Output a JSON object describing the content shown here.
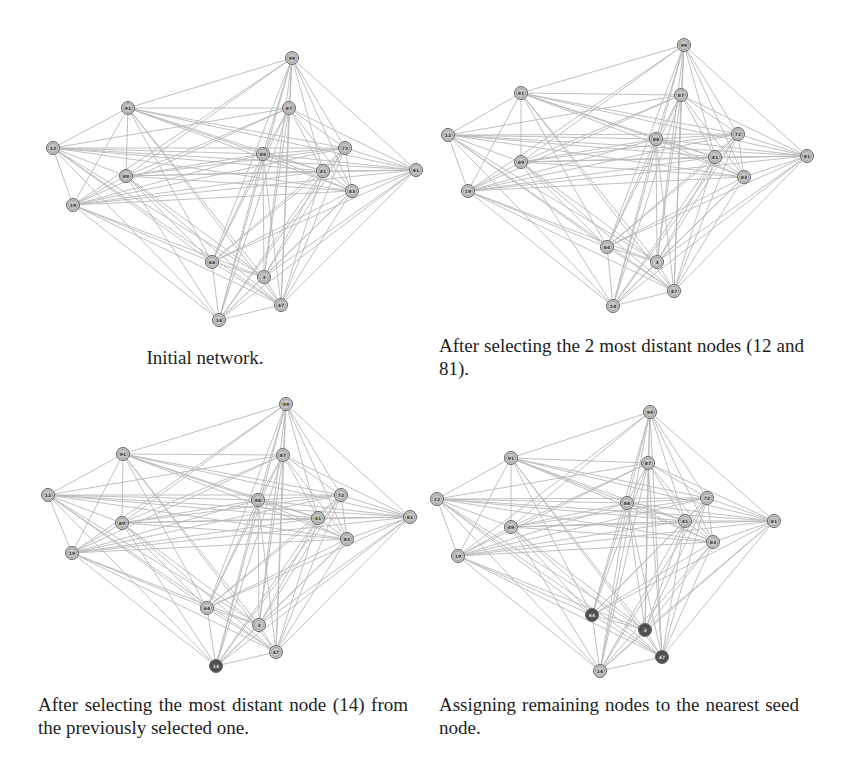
{
  "figure": {
    "panels": [
      {
        "id": "initial",
        "caption": "Initial network.",
        "highlighted_nodes": [],
        "seed_nodes": []
      },
      {
        "id": "two-distant",
        "caption": "After selecting the 2 most distant nodes (12 and 81).",
        "highlighted_nodes": [],
        "seed_nodes": [
          "12",
          "81"
        ]
      },
      {
        "id": "third-seed",
        "caption": "After selecting the most distant node (14) from the previously selected one.",
        "highlighted_nodes": [
          "14"
        ],
        "seed_nodes": [
          "12",
          "81",
          "14"
        ]
      },
      {
        "id": "assign",
        "caption": "Assigning remaining nodes to the nearest seed node.",
        "highlighted_nodes": [
          "64",
          "3",
          "47"
        ],
        "seed_nodes": [
          "12",
          "81",
          "14"
        ]
      }
    ],
    "node_labels": [
      "99",
      "91",
      "87",
      "12",
      "88",
      "72",
      "89",
      "41",
      "81",
      "83",
      "19",
      "64",
      "3",
      "47",
      "14"
    ],
    "colors": {
      "edge": "#b9b9b9",
      "node_fill": "#c9c9c9",
      "node_stroke": "#666666",
      "node_highlight": "#6e6e6e",
      "node_seed_dark": "#555555"
    }
  }
}
